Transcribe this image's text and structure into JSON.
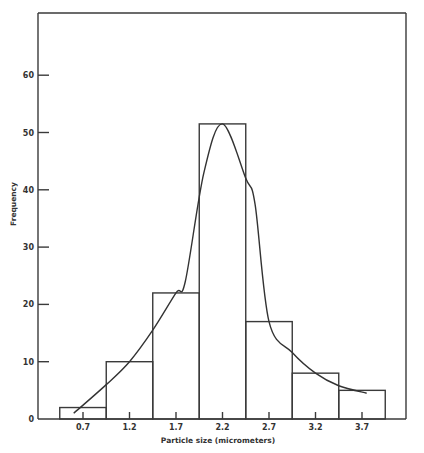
{
  "chart_data": {
    "type": "bar",
    "subtype": "histogram_with_fitted_curve",
    "title": "",
    "xlabel": "Particle size (micrometers)",
    "ylabel": "Frequency",
    "categories": [
      "0.7",
      "1.2",
      "1.7",
      "2.2",
      "2.7",
      "3.2",
      "3.7"
    ],
    "values": [
      2,
      10,
      22,
      51.5,
      17,
      8,
      5
    ],
    "bin_width": 0.5,
    "x_ticks": [
      "0.7",
      "1.2",
      "1.7",
      "2.2",
      "2.7",
      "3.2",
      "3.7"
    ],
    "y_ticks": [
      "0",
      "10",
      "20",
      "30",
      "40",
      "50",
      "60"
    ],
    "ylim": [
      0,
      70
    ],
    "xlim": [
      0.2,
      4.4
    ],
    "grid": false,
    "legend": null,
    "fitted_curve": {
      "description": "Smooth skewed bell-shaped frequency curve peaking near 2.2",
      "points": [
        [
          0.6,
          1
        ],
        [
          0.95,
          6
        ],
        [
          1.2,
          10
        ],
        [
          1.45,
          15.5
        ],
        [
          1.7,
          22
        ],
        [
          1.8,
          24
        ],
        [
          2.0,
          43
        ],
        [
          2.2,
          51.5
        ],
        [
          2.45,
          42
        ],
        [
          2.55,
          37.5
        ],
        [
          2.7,
          17
        ],
        [
          2.95,
          11.6
        ],
        [
          3.2,
          8
        ],
        [
          3.45,
          5.8
        ],
        [
          3.75,
          4.5
        ]
      ]
    }
  },
  "labels": {
    "x_axis_title": "Particle size (micrometers)",
    "y_axis_title": "Frequency"
  },
  "colors": {
    "line": "#333333",
    "background": "#ffffff"
  }
}
